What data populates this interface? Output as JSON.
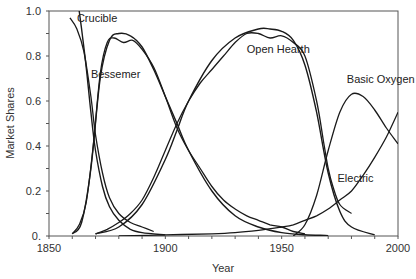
{
  "chart_data": {
    "type": "line",
    "title": "",
    "xlabel": "Year",
    "ylabel": "Market Shares",
    "xlim": [
      1850,
      2000
    ],
    "ylim": [
      0,
      1.0
    ],
    "x_ticks": [
      1850,
      1900,
      1950,
      2000
    ],
    "x_tick_labels": [
      "1850",
      "1900",
      "1950",
      "2000"
    ],
    "y_ticks": [
      0,
      0.2,
      0.4,
      0.6,
      0.8,
      1.0
    ],
    "y_tick_labels": [
      "0.",
      "0.2",
      "0.4",
      "0.6",
      "0.8",
      "1.0"
    ],
    "grid": false,
    "legend": "inline labels",
    "series": [
      {
        "name": "Crucible",
        "label_pos": [
          1862,
          0.97
        ],
        "x": [
          1859,
          1862,
          1865,
          1868,
          1870,
          1873,
          1876,
          1880,
          1885,
          1890,
          1895
        ],
        "values": [
          0.97,
          0.92,
          0.82,
          0.62,
          0.45,
          0.28,
          0.17,
          0.1,
          0.06,
          0.04,
          0.02
        ],
        "fit_x": [
          1863,
          1864,
          1866,
          1868,
          1870,
          1873,
          1876,
          1880,
          1885,
          1890,
          1900
        ],
        "fit_values": [
          1.0,
          0.92,
          0.75,
          0.55,
          0.38,
          0.22,
          0.13,
          0.07,
          0.03,
          0.015,
          0.005
        ]
      },
      {
        "name": "Bessemer",
        "label_pos": [
          1868,
          0.72
        ],
        "x": [
          1860,
          1863,
          1866,
          1869,
          1872,
          1875,
          1878,
          1882,
          1886,
          1890,
          1895,
          1900,
          1905,
          1910,
          1915,
          1920,
          1925,
          1930,
          1935,
          1940,
          1945,
          1950,
          1955,
          1960
        ],
        "values": [
          0.01,
          0.05,
          0.15,
          0.4,
          0.72,
          0.86,
          0.88,
          0.86,
          0.87,
          0.83,
          0.75,
          0.62,
          0.48,
          0.38,
          0.3,
          0.22,
          0.16,
          0.12,
          0.09,
          0.07,
          0.05,
          0.04,
          0.02,
          0.01
        ],
        "fit_x": [
          1860,
          1864,
          1868,
          1872,
          1876,
          1880,
          1885,
          1890,
          1895,
          1900,
          1905,
          1910,
          1920,
          1930,
          1940,
          1950,
          1960,
          1970
        ],
        "fit_values": [
          0.01,
          0.06,
          0.3,
          0.7,
          0.87,
          0.9,
          0.89,
          0.84,
          0.74,
          0.62,
          0.5,
          0.38,
          0.2,
          0.09,
          0.04,
          0.015,
          0.006,
          0.002
        ]
      },
      {
        "name": "Open Hearth",
        "label_pos": [
          1935,
          0.83
        ],
        "x": [
          1870,
          1875,
          1880,
          1885,
          1890,
          1895,
          1900,
          1905,
          1910,
          1915,
          1920,
          1925,
          1930,
          1935,
          1940,
          1945,
          1950,
          1955,
          1960,
          1965,
          1968,
          1970,
          1972,
          1975,
          1980
        ],
        "values": [
          0.01,
          0.03,
          0.06,
          0.1,
          0.16,
          0.26,
          0.38,
          0.5,
          0.6,
          0.68,
          0.74,
          0.8,
          0.86,
          0.9,
          0.9,
          0.88,
          0.89,
          0.86,
          0.8,
          0.6,
          0.42,
          0.3,
          0.22,
          0.14,
          0.1
        ],
        "fit_x": [
          1870,
          1880,
          1890,
          1900,
          1905,
          1910,
          1920,
          1930,
          1940,
          1945,
          1950,
          1955,
          1960,
          1965,
          1970,
          1975,
          1980,
          1990
        ],
        "fit_values": [
          0.01,
          0.04,
          0.14,
          0.34,
          0.47,
          0.6,
          0.78,
          0.88,
          0.92,
          0.92,
          0.91,
          0.87,
          0.76,
          0.55,
          0.28,
          0.11,
          0.04,
          0.005
        ]
      },
      {
        "name": "Basic Oxygen",
        "label_pos": [
          1978,
          0.7
        ],
        "x": [
          1955,
          1960,
          1965,
          1970,
          1975,
          1980,
          1985,
          1990,
          1995,
          2000
        ],
        "values": [
          0.0,
          0.05,
          0.18,
          0.38,
          0.55,
          0.63,
          0.62,
          0.56,
          0.48,
          0.41
        ]
      },
      {
        "name": "Electric",
        "label_pos": [
          1974,
          0.26
        ],
        "x": [
          1880,
          1900,
          1920,
          1930,
          1940,
          1950,
          1955,
          1960,
          1965,
          1970,
          1975,
          1980,
          1985,
          1990,
          1995,
          2000
        ],
        "values": [
          0.0,
          0.005,
          0.01,
          0.015,
          0.025,
          0.04,
          0.05,
          0.07,
          0.09,
          0.12,
          0.16,
          0.2,
          0.27,
          0.35,
          0.44,
          0.55
        ]
      }
    ]
  }
}
